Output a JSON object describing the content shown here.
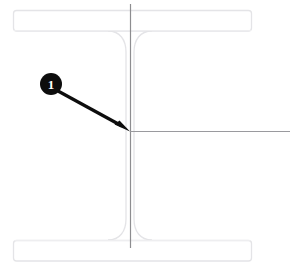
{
  "figure": {
    "background_color": "#ffffff",
    "width": 298,
    "height": 271
  },
  "drawing": {
    "subject": "wide-flange I-beam cross section",
    "outline_color": "#e8e8ea",
    "outline_color_dark": "#d8d8dc",
    "centerline_color": "#8d8d90",
    "reference_line_color": "#9a9a9e",
    "top_flange": {
      "label": "top flange",
      "x": 13,
      "y": 10,
      "width": 239,
      "height": 21
    },
    "bottom_flange": {
      "label": "bottom flange",
      "x": 13,
      "y": 240,
      "width": 239,
      "height": 21
    },
    "web": {
      "label": "web",
      "left_x": 126,
      "right_x": 134,
      "top_y": 31,
      "bottom_y": 240,
      "fillet_radius": 18
    },
    "vertical_centerline": {
      "label": "vertical centerline",
      "x": 130,
      "y1": 4,
      "y2": 248
    },
    "horizontal_reference_line": {
      "label": "horizontal reference line",
      "y": 131,
      "x1": 130,
      "x2": 290
    }
  },
  "callout": {
    "number": "1",
    "marker_color": "#0d0d0d",
    "text_color": "#ffffff",
    "circle": {
      "cx": 51,
      "cy": 84,
      "r": 11
    },
    "leader": {
      "label": "leader arrow",
      "from_x": 59,
      "from_y": 92,
      "to_x": 130,
      "to_y": 131,
      "color": "#0d0d0d",
      "width": 3
    }
  }
}
